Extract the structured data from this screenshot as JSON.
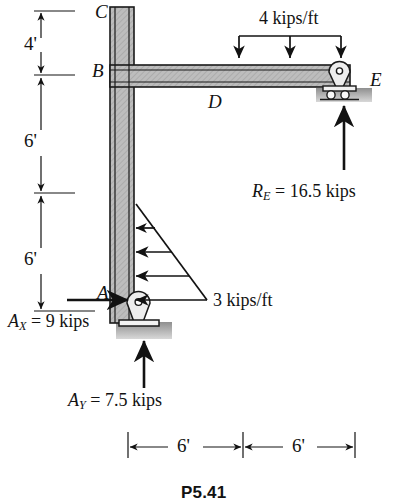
{
  "figure": {
    "caption": "P5.41",
    "points": [
      {
        "name": "C",
        "label": "C"
      },
      {
        "name": "B",
        "label": "B"
      },
      {
        "name": "D",
        "label": "D"
      },
      {
        "name": "E",
        "label": "E"
      },
      {
        "name": "A",
        "label": "A"
      }
    ],
    "vertical_dimensions": [
      {
        "label": "4'",
        "value": 4,
        "unit": "ft",
        "segment": "C to B"
      },
      {
        "label": "6'",
        "value": 6,
        "unit": "ft",
        "segment": "B to mid-column"
      },
      {
        "label": "6'",
        "value": 6,
        "unit": "ft",
        "segment": "mid-column to A"
      }
    ],
    "horizontal_dimensions": [
      {
        "label": "6'",
        "value": 6,
        "unit": "ft",
        "segment": "A to D"
      },
      {
        "label": "6'",
        "value": 6,
        "unit": "ft",
        "segment": "D to E"
      }
    ],
    "loads": [
      {
        "name": "beam-distributed-load",
        "label": "4 kips/ft",
        "magnitude": 4,
        "unit": "kips/ft",
        "direction": "down",
        "shape": "uniform",
        "applied_to": "beam B-E"
      },
      {
        "name": "column-distributed-load",
        "label": "3 kips/ft",
        "magnitude": 3,
        "unit": "kips/ft",
        "direction": "left",
        "shape": "triangular",
        "applied_to": "column lower 6 ft"
      }
    ],
    "reactions": [
      {
        "name": "reaction-ax",
        "symbol": "A",
        "subscript": "X",
        "equals": "= 9 kips",
        "value": 9,
        "unit": "kips",
        "direction": "right",
        "at": "A"
      },
      {
        "name": "reaction-ay",
        "symbol": "A",
        "subscript": "Y",
        "equals": "= 7.5 kips",
        "value": 7.5,
        "unit": "kips",
        "direction": "up",
        "at": "A"
      },
      {
        "name": "reaction-re",
        "symbol": "R",
        "subscript": "E",
        "equals": "= 16.5 kips",
        "value": 16.5,
        "unit": "kips",
        "direction": "up",
        "at": "E"
      }
    ],
    "supports": [
      {
        "name": "pin-support-a",
        "at": "A",
        "type": "pin"
      },
      {
        "name": "roller-support-e",
        "at": "E",
        "type": "roller"
      }
    ],
    "colors": {
      "member_fill": "#b9b9b9",
      "member_edge": "#1a1a1a",
      "ground_hatch": "#9a9a9a",
      "ink": "#121212"
    }
  }
}
